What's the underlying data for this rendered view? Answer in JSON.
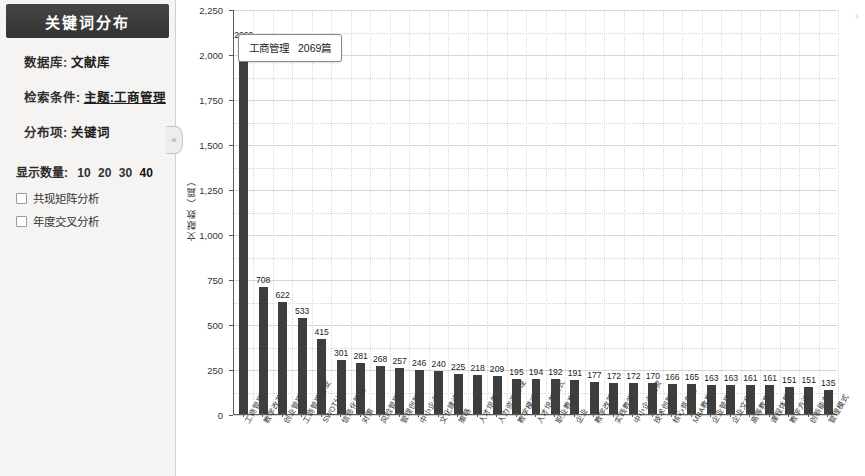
{
  "sidebar": {
    "title": "关键词分布",
    "collapse_icon": "«",
    "info": [
      {
        "label": "数据库:",
        "value": "文献库",
        "underline": false
      },
      {
        "label": "检索条件:",
        "value": "主题:工商管理",
        "underline": true
      },
      {
        "label": "分布项:",
        "value": "关键词",
        "underline": false
      }
    ],
    "count_label": "显示数量:",
    "count_options": [
      "10",
      "20",
      "30",
      "40"
    ],
    "count_selected": "40",
    "checkboxes": [
      {
        "label": "共现矩阵分析",
        "checked": false
      },
      {
        "label": "年度交叉分析",
        "checked": false
      }
    ]
  },
  "chart_panel": {
    "expand_icon": "›",
    "tooltip": {
      "name": "工商管理",
      "value": "2069篇"
    }
  },
  "chart_data": {
    "type": "bar",
    "title": "",
    "xlabel": "",
    "ylabel": "文献数（篇）",
    "ylim": [
      0,
      2250
    ],
    "yticks": [
      0,
      250,
      500,
      750,
      1000,
      1250,
      1500,
      1750,
      2000,
      2250
    ],
    "ytick_labels": [
      "0",
      "250",
      "500",
      "750",
      "1,000",
      "1,250",
      "1,500",
      "1,750",
      "2,000",
      "2,250"
    ],
    "grid": true,
    "legend": false,
    "bar_color": "#3e3e3e",
    "categories": [
      "工商管理",
      "教学改革",
      "创业管理",
      "工商管理专业",
      "SWOT分析",
      "信息化管理",
      "对策",
      "风险管理",
      "管理创新",
      "中小企业",
      "文化建设",
      "策略",
      "人才培养",
      "人力资源管理",
      "教学模式",
      "人才培养模式",
      "职业教育",
      "企业",
      "教学改革",
      "实践教学",
      "中小企业融资",
      "技术创新",
      "核心竞争力",
      "MBA教育",
      "企业管理",
      "企业文化",
      "高等教育",
      "课程体系",
      "教学方法",
      "创新能力",
      "管理模式",
      "人力资源",
      "应用型人才",
      "案例教学",
      "实践能力",
      "市场营销",
      "培养模式",
      "创新创业",
      "电子商务",
      "教学质量"
    ],
    "values": [
      2069,
      708,
      622,
      533,
      415,
      301,
      281,
      268,
      257,
      246,
      240,
      225,
      218,
      209,
      195,
      194,
      192,
      191,
      177,
      172,
      172,
      170,
      166,
      165,
      163,
      163,
      161,
      161,
      151,
      151,
      135,
      0,
      0,
      0,
      0,
      0,
      0,
      0,
      0,
      0
    ],
    "n_bars": 31
  }
}
